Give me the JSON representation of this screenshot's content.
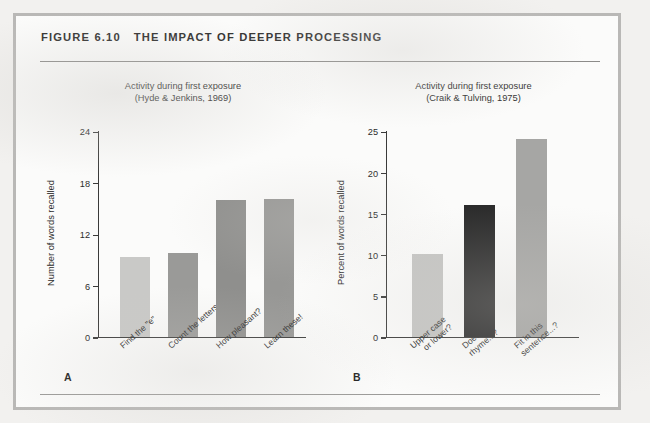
{
  "figure": {
    "number_label": "FIGURE 6.10",
    "title": "THE IMPACT OF DEEPER PROCESSING"
  },
  "panels": [
    {
      "letter": "A",
      "subtitle_line1": "Activity during first exposure",
      "subtitle_line2": "(Hyde & Jenkins, 1969)"
    },
    {
      "letter": "B",
      "subtitle_line1": "Activity during first exposure",
      "subtitle_line2": "(Craik & Tulving, 1975)"
    }
  ],
  "chart_data": [
    {
      "type": "bar",
      "panel": "A",
      "title": "Activity during first exposure (Hyde & Jenkins, 1969)",
      "xlabel": "",
      "ylabel": "Number of words recalled",
      "categories": [
        "Find the \"e\"",
        "Count the letters",
        "How pleasant?",
        "Learn these!"
      ],
      "category_lines": [
        [
          "Find the \"e\""
        ],
        [
          "Count the letters"
        ],
        [
          "How pleasant?"
        ],
        [
          "Learn these!"
        ]
      ],
      "values": [
        9.3,
        9.8,
        16,
        16.1
      ],
      "bar_colors": [
        "#c9c9c7",
        "#9a9a98",
        "#8f8f8d",
        "#979795"
      ],
      "ylim": [
        0,
        24
      ],
      "yticks": [
        0,
        6,
        12,
        18,
        24
      ],
      "grid": false,
      "legend": "none"
    },
    {
      "type": "bar",
      "panel": "B",
      "title": "Activity during first exposure (Craik & Tulving, 1975)",
      "xlabel": "",
      "ylabel": "Percent of words recalled",
      "categories": [
        "Upper case or lower?",
        "Does it rhyme...?",
        "Fit in this sentence...?"
      ],
      "category_lines": [
        [
          "Upper case",
          "or lower?"
        ],
        [
          "Does it",
          "rhyme...?"
        ],
        [
          "Fit in this",
          "sentence...?"
        ]
      ],
      "values": [
        10,
        16,
        24
      ],
      "bar_colors": [
        "#c5c5c3",
        "#2b2b2b",
        "#a6a6a4"
      ],
      "ylim": [
        0,
        25
      ],
      "yticks": [
        0,
        5,
        10,
        15,
        20,
        25
      ],
      "grid": false,
      "legend": "none"
    }
  ],
  "colors": {
    "page_background": "#f2f1ef",
    "frame_border": "#b9b8b6",
    "panel_background": "#fbfbfa",
    "rule": "#8c8b89",
    "axis": "#3a3a39",
    "text": "#2d2d2c"
  }
}
